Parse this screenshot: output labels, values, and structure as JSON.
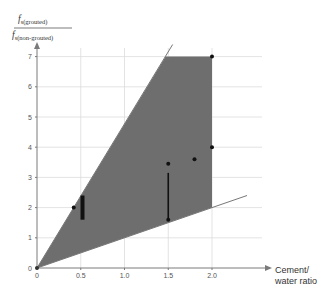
{
  "chart_data": {
    "type": "scatter",
    "title": "",
    "xlabel": "Cement/ water ratio",
    "xlabel_lines": [
      "Cement/",
      "water ratio"
    ],
    "ylabel_numerator": "f_s(grouted)",
    "ylabel_denominator": "f_s(non-grouted)",
    "ylabel_num_text": "f",
    "ylabel_num_sub": "s(grouted)",
    "ylabel_den_text": "f",
    "ylabel_den_sub": "s(non-grouted)",
    "xlim": [
      0,
      2.6
    ],
    "ylim": [
      0,
      7.5
    ],
    "x_ticks": [
      "0",
      "0.5",
      "1.0",
      "1.5",
      "2.0"
    ],
    "x_tick_values": [
      0,
      0.5,
      1.0,
      1.5,
      2.0
    ],
    "y_ticks": [
      "0",
      "1",
      "2",
      "3",
      "4",
      "5",
      "6",
      "7"
    ],
    "y_tick_values": [
      0,
      1,
      2,
      3,
      4,
      5,
      6,
      7
    ],
    "grid": true,
    "shaded_region": {
      "description": "Envelope between upper and lower bounding lines, capped at y=7 and x=2.0",
      "polygon": [
        [
          0,
          0
        ],
        [
          1.47,
          7.0
        ],
        [
          2.0,
          7.0
        ],
        [
          2.0,
          2.0
        ],
        [
          0,
          0
        ]
      ],
      "color": "#6e6e6e"
    },
    "bounding_lines": [
      {
        "name": "upper",
        "from": [
          0,
          0
        ],
        "to": [
          1.55,
          7.4
        ]
      },
      {
        "name": "lower",
        "from": [
          0,
          0
        ],
        "to": [
          2.4,
          2.4
        ]
      }
    ],
    "points": [
      {
        "x": 0.42,
        "y": 2.0
      },
      {
        "x": 1.5,
        "y": 3.45
      },
      {
        "x": 1.8,
        "y": 3.6
      },
      {
        "x": 2.0,
        "y": 4.0
      },
      {
        "x": 2.0,
        "y": 7.0
      },
      {
        "x": 1.5,
        "y": 1.6
      }
    ],
    "ranges": [
      {
        "x": 0.52,
        "y_low": 1.6,
        "y_high": 2.4,
        "style": "thick"
      },
      {
        "x": 1.5,
        "y_low": 1.6,
        "y_high": 3.15,
        "style": "thin"
      }
    ]
  },
  "colors": {
    "shade": "#6e6e6e",
    "axis": "#7a7a7a",
    "grid": "#dcdcdc",
    "point": "#111111"
  }
}
